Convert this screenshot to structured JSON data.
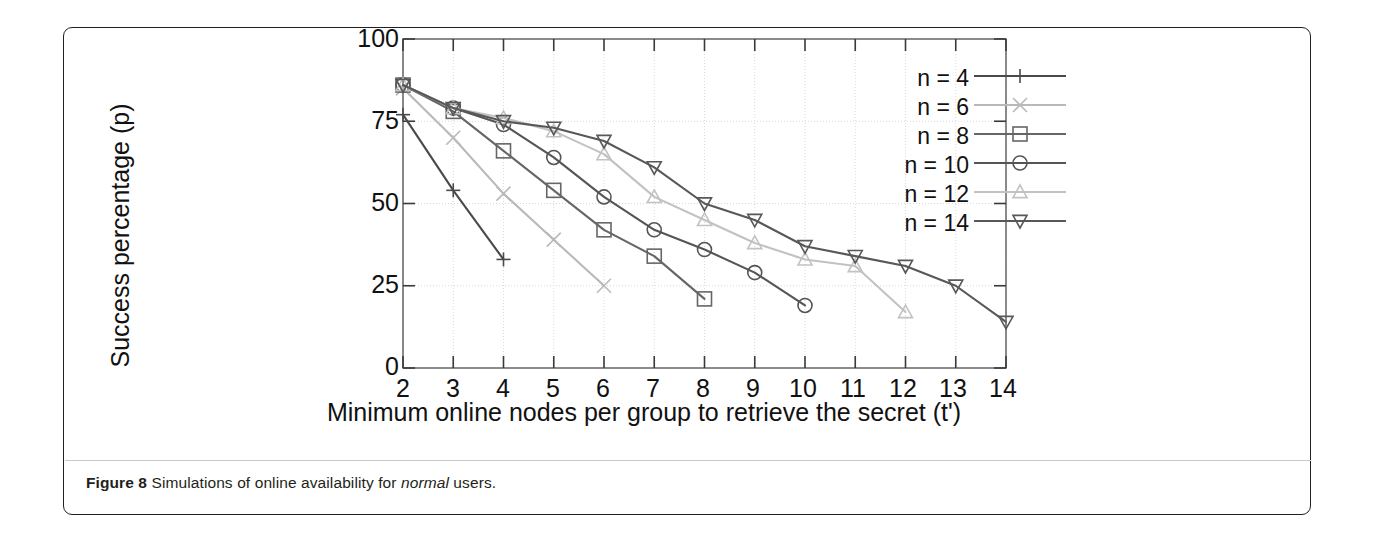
{
  "figure": {
    "caption_label": "Figure 8",
    "caption_text": " Simulations of online availability for ",
    "caption_emphasis": "normal",
    "caption_tail": " users."
  },
  "chart_data": {
    "type": "line",
    "title": "",
    "xlabel": "Minimum online nodes per group to retrieve the secret (t')",
    "ylabel": "Success percentage (p)",
    "xlim": [
      2,
      14
    ],
    "ylim": [
      0,
      100
    ],
    "xticks": [
      "2",
      "3",
      "4",
      "5",
      "6",
      "7",
      "8",
      "9",
      "10",
      "11",
      "12",
      "13",
      "14"
    ],
    "yticks": [
      "0",
      "25",
      "50",
      "75",
      "100"
    ],
    "grid": true,
    "legend_position": "top-right",
    "series": [
      {
        "name": "n = 4",
        "marker": "plus",
        "color": "#4a4a4a",
        "x": [
          2,
          3,
          4
        ],
        "y": [
          77,
          54,
          33
        ]
      },
      {
        "name": "n = 6",
        "marker": "cross",
        "color": "#b9b9b9",
        "x": [
          2,
          3,
          4,
          5,
          6
        ],
        "y": [
          85,
          70,
          53,
          39,
          25
        ]
      },
      {
        "name": "n = 8",
        "marker": "square",
        "color": "#666666",
        "x": [
          2,
          3,
          4,
          5,
          6,
          7,
          8
        ],
        "y": [
          86,
          78,
          66,
          54,
          42,
          34,
          21
        ]
      },
      {
        "name": "n = 10",
        "marker": "circle",
        "color": "#555555",
        "x": [
          2,
          3,
          4,
          5,
          6,
          7,
          8,
          9,
          10
        ],
        "y": [
          86,
          79,
          74,
          64,
          52,
          42,
          36,
          29,
          19
        ]
      },
      {
        "name": "n = 12",
        "marker": "triangle-up",
        "color": "#c2c2c2",
        "x": [
          2,
          3,
          4,
          5,
          6,
          7,
          8,
          9,
          10,
          11,
          12
        ],
        "y": [
          86,
          79,
          76,
          72,
          65,
          52,
          45,
          38,
          33,
          31,
          17
        ]
      },
      {
        "name": "n = 14",
        "marker": "triangle-down",
        "color": "#585858",
        "x": [
          2,
          3,
          4,
          5,
          6,
          7,
          8,
          9,
          10,
          11,
          12,
          13,
          14
        ],
        "y": [
          86,
          79,
          75,
          73,
          69,
          61,
          50,
          45,
          37,
          34,
          31,
          25,
          14
        ]
      }
    ]
  },
  "legend": {
    "items": [
      {
        "label": "n = 4"
      },
      {
        "label": "n = 6"
      },
      {
        "label": "n = 8"
      },
      {
        "label": "n = 10"
      },
      {
        "label": "n = 12"
      },
      {
        "label": "n = 14"
      }
    ]
  },
  "axes": {
    "y_labels": [
      "100",
      "75",
      "50",
      "25",
      "0"
    ],
    "x_labels": [
      "2",
      "3",
      "4",
      "5",
      "6",
      "7",
      "8",
      "9",
      "10",
      "11",
      "12",
      "13",
      "14"
    ]
  }
}
